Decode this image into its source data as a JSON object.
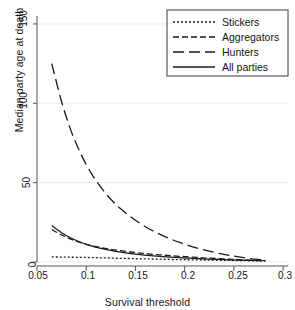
{
  "chart_data": {
    "type": "line",
    "title": "",
    "xlabel": "Survival threshold",
    "ylabel": "Median party age at death",
    "xlim": [
      0.05,
      0.305
    ],
    "ylim": [
      0,
      155
    ],
    "xticks": [
      0.05,
      0.1,
      0.15,
      0.2,
      0.25,
      0.3
    ],
    "xticklabels": [
      "0.05",
      "0.1",
      "0.15",
      "0.2",
      "0.25",
      "0.3"
    ],
    "yticks": [
      0,
      50,
      100,
      150
    ],
    "yticklabels": [
      "0",
      "50",
      "100",
      "150"
    ],
    "grid": "horizontal",
    "grid_color": "#ededed",
    "legend_position": "top-right",
    "line_color": "#1a1a1a",
    "x": [
      0.065,
      0.075,
      0.085,
      0.095,
      0.105,
      0.115,
      0.125,
      0.135,
      0.145,
      0.155,
      0.165,
      0.175,
      0.185,
      0.195,
      0.205,
      0.215,
      0.225,
      0.235,
      0.245,
      0.255,
      0.265,
      0.275,
      0.282
    ],
    "series": [
      {
        "name": "Stickers",
        "dash": "2,2",
        "values": [
          3.2,
          3.1,
          3.0,
          2.9,
          2.8,
          2.6,
          2.5,
          2.3,
          2.2,
          2.0,
          1.9,
          1.8,
          1.6,
          1.5,
          1.4,
          1.3,
          1.2,
          1.1,
          1.0,
          0.9,
          0.8,
          0.7,
          0.7
        ]
      },
      {
        "name": "Aggregators",
        "dash": "6,3",
        "values": [
          20.5,
          17.0,
          14.2,
          12.1,
          10.4,
          9.1,
          8.0,
          7.1,
          6.3,
          5.6,
          5.0,
          4.5,
          4.0,
          3.6,
          3.2,
          2.8,
          2.4,
          2.1,
          1.8,
          1.5,
          1.2,
          1.0,
          0.9
        ]
      },
      {
        "name": "Hunters",
        "dash": "11,5",
        "values": [
          125.0,
          101.0,
          82.0,
          67.5,
          56.0,
          47.0,
          39.5,
          33.5,
          28.5,
          24.2,
          20.5,
          17.4,
          14.7,
          12.3,
          10.2,
          8.4,
          6.8,
          5.4,
          4.2,
          3.2,
          2.3,
          1.6,
          1.2
        ]
      },
      {
        "name": "All parties",
        "dash": "none",
        "values": [
          23.0,
          18.5,
          15.0,
          12.3,
          10.2,
          8.6,
          7.3,
          6.2,
          5.3,
          4.6,
          4.0,
          3.5,
          3.1,
          2.7,
          2.4,
          2.1,
          1.8,
          1.6,
          1.4,
          1.2,
          1.0,
          0.9,
          0.8
        ]
      }
    ]
  },
  "legend": {
    "entries": [
      {
        "label": "Stickers"
      },
      {
        "label": "Aggregators"
      },
      {
        "label": "Hunters"
      },
      {
        "label": "All parties"
      }
    ]
  }
}
